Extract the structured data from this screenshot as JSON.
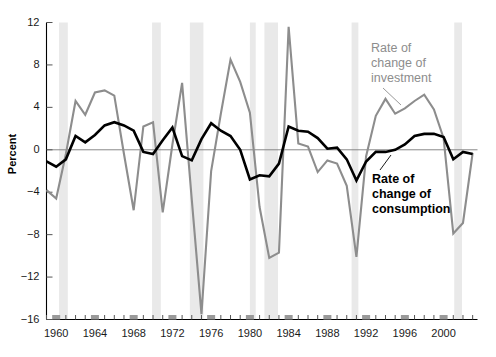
{
  "chart_data": {
    "type": "line",
    "title": "",
    "xlabel": "",
    "ylabel": "Percent",
    "xlim": [
      1959.0,
      2003.5
    ],
    "ylim": [
      -16,
      12
    ],
    "grid": false,
    "zero_line": true,
    "legend_position": "in-plot annotations",
    "y_ticks": [
      12,
      8,
      4,
      0,
      -4,
      -8,
      -12,
      -16
    ],
    "y_tick_labels": [
      "12",
      "8",
      "4",
      "0",
      "−4",
      "−8",
      "−12",
      "−16"
    ],
    "x_ticks_major": [
      1960,
      1964,
      1968,
      1972,
      1976,
      1980,
      1984,
      1988,
      1992,
      1996,
      2000
    ],
    "x_tick_labels": [
      "1960",
      "1964",
      "1968",
      "1972",
      "1976",
      "1980",
      "1984",
      "1988",
      "1992",
      "1996",
      "2000"
    ],
    "x_minor_tick_step": 1,
    "annotations": [
      {
        "name": "investment-label",
        "text": "Rate of\nchange of\ninvestment",
        "lines": [
          "Rate of",
          "change of",
          "investment"
        ],
        "color": "#8d8d8d",
        "bold": false,
        "leader_from": [
          383,
          88
        ],
        "leader_to": [
          401,
          105
        ]
      },
      {
        "name": "consumption-label",
        "text": "Rate of\nchange of\nconsumption",
        "lines": [
          "Rate of",
          "change of",
          "consumption"
        ],
        "color": "#000000",
        "bold": true,
        "leader_from": [
          380,
          170
        ],
        "leader_to": [
          391,
          155
        ]
      }
    ],
    "recession_bands": {
      "color": "#e9e9e9",
      "periods": [
        [
          1960.3,
          1961.2
        ],
        [
          1969.9,
          1970.8
        ],
        [
          1973.8,
          1975.2
        ],
        [
          1980.0,
          1980.6
        ],
        [
          1981.5,
          1982.9
        ],
        [
          1990.5,
          1991.2
        ],
        [
          2001.1,
          2001.9
        ]
      ]
    },
    "series": [
      {
        "name": "Rate of change of investment",
        "color": "#8d8d8d",
        "width": 2.1,
        "x": [
          1959,
          1960,
          1961,
          1962,
          1963,
          1964,
          1965,
          1966,
          1967,
          1968,
          1969,
          1970,
          1971,
          1972,
          1973,
          1974,
          1975,
          1976,
          1977,
          1978,
          1979,
          1980,
          1981,
          1982,
          1983,
          1984,
          1985,
          1986,
          1987,
          1988,
          1989,
          1990,
          1991,
          1992,
          1993,
          1994,
          1995,
          1996,
          1997,
          1998,
          1999,
          2000,
          2001,
          2002,
          2003
        ],
        "values": [
          -3.8,
          -4.6,
          -0.4,
          4.6,
          3.3,
          5.4,
          5.6,
          5.1,
          -0.4,
          -5.7,
          2.2,
          2.6,
          -5.9,
          0.5,
          6.3,
          -4.7,
          -15.5,
          -2.0,
          3.4,
          8.5,
          6.4,
          3.5,
          -5.4,
          -10.2,
          -9.7,
          11.6,
          0.6,
          0.3,
          -2.1,
          -1.0,
          -1.3,
          -3.4,
          -10.1,
          -0.6,
          3.2,
          4.8,
          3.4,
          3.9,
          4.6,
          5.2,
          3.8,
          1.1,
          -7.9,
          -6.9,
          -0.3
        ]
      },
      {
        "name": "Rate of change of consumption",
        "color": "#000000",
        "width": 2.6,
        "x": [
          1959,
          1960,
          1961,
          1962,
          1963,
          1964,
          1965,
          1966,
          1967,
          1968,
          1969,
          1970,
          1971,
          1972,
          1973,
          1974,
          1975,
          1976,
          1977,
          1978,
          1979,
          1980,
          1981,
          1982,
          1983,
          1984,
          1985,
          1986,
          1987,
          1988,
          1989,
          1990,
          1991,
          1992,
          1993,
          1994,
          1995,
          1996,
          1997,
          1998,
          1999,
          2000,
          2001,
          2002,
          2003
        ],
        "values": [
          -1.1,
          -1.6,
          -0.9,
          1.3,
          0.7,
          1.4,
          2.3,
          2.6,
          2.3,
          1.8,
          -0.2,
          -0.4,
          0.9,
          2.1,
          -0.6,
          -1.0,
          1.0,
          2.5,
          1.8,
          1.3,
          0.0,
          -2.8,
          -2.4,
          -2.5,
          -1.3,
          2.2,
          1.8,
          1.7,
          1.1,
          0.1,
          0.2,
          -0.9,
          -2.9,
          -1.1,
          -0.2,
          -0.2,
          0.0,
          0.5,
          1.3,
          1.5,
          1.5,
          1.2,
          -0.9,
          -0.2,
          -0.4
        ]
      }
    ]
  },
  "axes": {
    "y_axis_name": "percent-axis",
    "x_axis_name": "year-axis"
  }
}
